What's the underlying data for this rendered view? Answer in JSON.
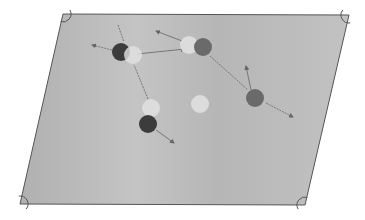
{
  "diagram": {
    "kind": "billiard-table-perspective",
    "colors": {
      "background": "#ffffff",
      "table_felt": "#b9b9b9",
      "table_edge": "#555555",
      "arrow": "#777777",
      "ball_dark": "#3c3c3c",
      "ball_medium": "#6a6a6a",
      "ball_light": "#dcdcdc",
      "ball_ghost": "#e2e2e2"
    },
    "table": {
      "corners": [
        [
          63,
          14
        ],
        [
          349,
          15
        ],
        [
          305,
          205
        ],
        [
          20,
          204
        ]
      ]
    },
    "pockets": [
      {
        "name": "top-left",
        "x": 63,
        "y": 14
      },
      {
        "name": "top-right",
        "x": 349,
        "y": 15
      },
      {
        "name": "bottom-right",
        "x": 305,
        "y": 205
      },
      {
        "name": "bottom-left",
        "x": 20,
        "y": 204
      }
    ],
    "balls": [
      {
        "id": "dark-ball-1",
        "x": 121,
        "y": 52,
        "r": 9,
        "shade": "dark"
      },
      {
        "id": "ghost-ball-1",
        "x": 133,
        "y": 55,
        "r": 9,
        "shade": "ghost"
      },
      {
        "id": "light-ball-1",
        "x": 189,
        "y": 45,
        "r": 9,
        "shade": "light"
      },
      {
        "id": "medium-ball-1",
        "x": 203,
        "y": 47,
        "r": 9,
        "shade": "medium"
      },
      {
        "id": "medium-ball-2",
        "x": 255,
        "y": 98,
        "r": 9,
        "shade": "medium"
      },
      {
        "id": "light-ball-2",
        "x": 200,
        "y": 104,
        "r": 9,
        "shade": "light"
      },
      {
        "id": "light-ball-3",
        "x": 151,
        "y": 108,
        "r": 9,
        "shade": "light"
      },
      {
        "id": "dark-ball-2",
        "x": 148,
        "y": 124,
        "r": 9,
        "shade": "dark"
      }
    ],
    "arrows": [
      {
        "id": "arrow-up-left-from-dark-1",
        "x1": 112,
        "y1": 50,
        "x2": 92,
        "y2": 45,
        "dashed": true
      },
      {
        "id": "arrow-top-line-into-dark-1",
        "x1": 118,
        "y1": 25,
        "x2": 124,
        "y2": 42,
        "dashed": true,
        "head": false
      },
      {
        "id": "arrow-dark-1-to-light-1",
        "x1": 137,
        "y1": 54,
        "x2": 185,
        "y2": 49,
        "dashed": false
      },
      {
        "id": "arrow-light-1-up-left",
        "x1": 182,
        "y1": 41,
        "x2": 156,
        "y2": 31,
        "dashed": false
      },
      {
        "id": "arrow-medium-1-to-medium-2",
        "x1": 210,
        "y1": 56,
        "x2": 248,
        "y2": 90,
        "dashed": true,
        "head": false
      },
      {
        "id": "arrow-medium-2-up",
        "x1": 251,
        "y1": 90,
        "x2": 246,
        "y2": 66,
        "dashed": false
      },
      {
        "id": "arrow-medium-2-down-right",
        "x1": 266,
        "y1": 103,
        "x2": 293,
        "y2": 117,
        "dashed": true
      },
      {
        "id": "arrow-vertical-to-light-3",
        "x1": 148,
        "y1": 99,
        "x2": 134,
        "y2": 65,
        "dashed": true,
        "head": false
      },
      {
        "id": "arrow-dark-2-down-right",
        "x1": 156,
        "y1": 130,
        "x2": 174,
        "y2": 143,
        "dashed": false
      }
    ]
  }
}
